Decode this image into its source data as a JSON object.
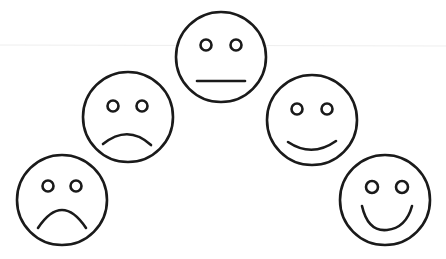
{
  "scene": {
    "background": "#ffffff",
    "stroke_color": "#1a1a1a",
    "guide_line_color": "#eeeeee"
  },
  "faces": [
    {
      "name": "very-sad",
      "cx": 62,
      "cy": 200,
      "r": 45,
      "mouth": "deep-frown"
    },
    {
      "name": "sad",
      "cx": 128,
      "cy": 117,
      "r": 45,
      "mouth": "frown"
    },
    {
      "name": "neutral",
      "cx": 221,
      "cy": 57,
      "r": 45,
      "mouth": "flat"
    },
    {
      "name": "happy",
      "cx": 312,
      "cy": 120,
      "r": 45,
      "mouth": "smile"
    },
    {
      "name": "very-happy",
      "cx": 385,
      "cy": 200,
      "r": 45,
      "mouth": "big-smile"
    }
  ]
}
